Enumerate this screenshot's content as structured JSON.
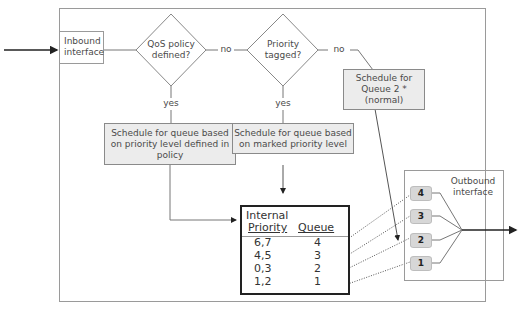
{
  "diagram": {
    "inbound_interface": {
      "line1": "Inbound",
      "line2": "interface"
    },
    "decision_qos": {
      "line1": "QoS policy",
      "line2": "defined?"
    },
    "decision_priority": {
      "line1": "Priority",
      "line2": "tagged?"
    },
    "edge_labels": {
      "qos_no": "no",
      "priority_no": "no",
      "qos_yes": "yes",
      "priority_yes": "yes"
    },
    "schedule_policy": {
      "line1": "Schedule for queue based",
      "line2": "on priority level defined in",
      "line3": "policy"
    },
    "schedule_marked": {
      "line1": "Schedule for queue based",
      "line2": "on marked priority level"
    },
    "schedule_queue2": {
      "line1": "Schedule for",
      "line2": "Queue 2 *",
      "line3": "(normal)"
    },
    "priority_table": {
      "header_col1_line1": "Internal",
      "header_col1_line2": "Priority",
      "header_col2": "Queue",
      "rows": [
        {
          "priority": "6,7",
          "queue": "4"
        },
        {
          "priority": "4,5",
          "queue": "3"
        },
        {
          "priority": "0,3",
          "queue": "2"
        },
        {
          "priority": "1,2",
          "queue": "1"
        }
      ]
    },
    "outbound_interface": {
      "line1": "Outbound",
      "line2": "interface"
    },
    "queues": [
      "4",
      "3",
      "2",
      "1"
    ]
  }
}
